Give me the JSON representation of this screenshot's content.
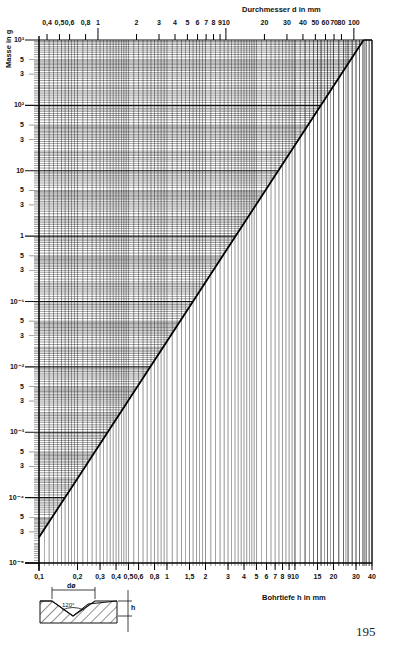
{
  "chart_data": {
    "type": "line",
    "title": "",
    "subtitle": "Nomogram: mass of 120° conical drill point vs. drilling depth / diameter",
    "ylabel": "Masse in g",
    "xlabel_bottom": "Bohrtiefe h in mm",
    "xlabel_top": "Durchmesser d in mm",
    "yscale": "log",
    "xscale": "log",
    "ylim": [
      1e-05,
      1000
    ],
    "xlim_bottom": [
      0.1,
      40
    ],
    "xlim_top": [
      0.346,
      138.6
    ],
    "grid": true,
    "y_ticks": [
      {
        "value": 1000,
        "label": "10³"
      },
      {
        "value": 500,
        "label": "5"
      },
      {
        "value": 300,
        "label": "3"
      },
      {
        "value": 100,
        "label": "10²"
      },
      {
        "value": 50,
        "label": "5"
      },
      {
        "value": 30,
        "label": "3"
      },
      {
        "value": 10,
        "label": "10"
      },
      {
        "value": 5,
        "label": "5"
      },
      {
        "value": 3,
        "label": "3"
      },
      {
        "value": 1,
        "label": "1"
      },
      {
        "value": 0.5,
        "label": "5"
      },
      {
        "value": 0.3,
        "label": "3"
      },
      {
        "value": 0.1,
        "label": "10⁻¹"
      },
      {
        "value": 0.05,
        "label": "5"
      },
      {
        "value": 0.03,
        "label": "3"
      },
      {
        "value": 0.01,
        "label": "10⁻²"
      },
      {
        "value": 0.005,
        "label": "5"
      },
      {
        "value": 0.003,
        "label": "3"
      },
      {
        "value": 0.001,
        "label": "10⁻³"
      },
      {
        "value": 0.0005,
        "label": "5"
      },
      {
        "value": 0.0003,
        "label": "3"
      },
      {
        "value": 0.0001,
        "label": "10⁻⁴"
      },
      {
        "value": 5e-05,
        "label": "5"
      },
      {
        "value": 3e-05,
        "label": "3"
      },
      {
        "value": 1e-05,
        "label": "10⁻⁵"
      }
    ],
    "x_bottom_ticks": [
      {
        "value": 0.1,
        "label": "0,1"
      },
      {
        "value": 0.2,
        "label": "0,2"
      },
      {
        "value": 0.3,
        "label": "0,3"
      },
      {
        "value": 0.4,
        "label": "0,4"
      },
      {
        "value": 0.5,
        "label": "0,5"
      },
      {
        "value": 0.6,
        "label": "0,6"
      },
      {
        "value": 0.8,
        "label": "0,8"
      },
      {
        "value": 1,
        "label": "1"
      },
      {
        "value": 1.5,
        "label": "1,5"
      },
      {
        "value": 2,
        "label": "2"
      },
      {
        "value": 3,
        "label": "3"
      },
      {
        "value": 4,
        "label": "4"
      },
      {
        "value": 5,
        "label": "5"
      },
      {
        "value": 6,
        "label": "6"
      },
      {
        "value": 7,
        "label": "7"
      },
      {
        "value": 8,
        "label": "8"
      },
      {
        "value": 9,
        "label": "9"
      },
      {
        "value": 10,
        "label": "10"
      },
      {
        "value": 15,
        "label": "15"
      },
      {
        "value": 20,
        "label": "20"
      },
      {
        "value": 30,
        "label": "30"
      },
      {
        "value": 40,
        "label": "40"
      }
    ],
    "x_top_ticks": [
      {
        "value": 0.4,
        "label": "0,4"
      },
      {
        "value": 0.5,
        "label": "0,5"
      },
      {
        "value": 0.6,
        "label": "0,6"
      },
      {
        "value": 0.8,
        "label": "0,8"
      },
      {
        "value": 1,
        "label": "1"
      },
      {
        "value": 2,
        "label": "2"
      },
      {
        "value": 3,
        "label": "3"
      },
      {
        "value": 4,
        "label": "4"
      },
      {
        "value": 5,
        "label": "5"
      },
      {
        "value": 6,
        "label": "6"
      },
      {
        "value": 7,
        "label": "7"
      },
      {
        "value": 8,
        "label": "8"
      },
      {
        "value": 9,
        "label": "9"
      },
      {
        "value": 10,
        "label": "10"
      },
      {
        "value": 20,
        "label": "20"
      },
      {
        "value": 30,
        "label": "30"
      },
      {
        "value": 40,
        "label": "40"
      },
      {
        "value": 50,
        "label": "50"
      },
      {
        "value": 60,
        "label": "60"
      },
      {
        "value": 70,
        "label": "70"
      },
      {
        "value": 80,
        "label": "80"
      },
      {
        "value": 100,
        "label": "100"
      }
    ],
    "series": [
      {
        "name": "Masse (Stahl, 120° Kegel)",
        "x": [
          0.1,
          0.2,
          0.5,
          1,
          2,
          5,
          10,
          20,
          34.4
        ],
        "y": [
          2.47e-05,
          0.000197,
          0.00308,
          0.0247,
          0.197,
          3.08,
          24.7,
          197,
          1000
        ]
      }
    ],
    "annotations": {
      "diagram_angle": "120°",
      "diagram_diameter": "dø",
      "diagram_depth": "h"
    }
  },
  "page": {
    "number": "195"
  }
}
